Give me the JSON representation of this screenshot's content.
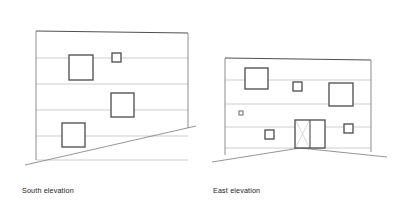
{
  "page": {
    "background_color": "#ffffff",
    "width": 393,
    "height": 216
  },
  "style": {
    "outline_color": "#3a3a3a",
    "floor_line_color": "#b9b9b9",
    "ground_line_color": "#7a7a7a",
    "opening_color": "#4a4a4a",
    "glazing_color": "#c9c9c9",
    "outline_width": 0.9,
    "floor_line_width": 0.7,
    "ground_line_width": 0.8,
    "opening_width": 1.3
  },
  "drawings": [
    {
      "id": "south-elevation",
      "caption": "South elevation",
      "caption_pos": {
        "x": 22,
        "y": 186
      },
      "outline": [
        {
          "x": 36,
          "y": 31
        },
        {
          "x": 188,
          "y": 33
        },
        {
          "x": 188,
          "y": 128
        },
        {
          "x": 36,
          "y": 160
        }
      ],
      "wall_left": {
        "x1": 36,
        "y1": 31,
        "x2": 36,
        "y2": 160
      },
      "wall_right": {
        "x1": 188,
        "y1": 33,
        "x2": 188,
        "y2": 128
      },
      "wall_top": {
        "x1": 36,
        "y1": 31,
        "x2": 188,
        "y2": 33
      },
      "floor_lines": [
        {
          "x1": 36,
          "y1": 58,
          "x2": 188,
          "y2": 58
        },
        {
          "x1": 36,
          "y1": 84,
          "x2": 188,
          "y2": 84
        },
        {
          "x1": 36,
          "y1": 110,
          "x2": 188,
          "y2": 110
        },
        {
          "x1": 36,
          "y1": 136,
          "x2": 188,
          "y2": 136
        },
        {
          "x1": 36,
          "y1": 160,
          "x2": 188,
          "y2": 160
        }
      ],
      "ground_line": {
        "x1": 25,
        "y1": 165,
        "x2": 196,
        "y2": 126
      },
      "openings": [
        {
          "name": "window-upper-left",
          "x": 69,
          "y": 55,
          "w": 24,
          "h": 25,
          "type": "window"
        },
        {
          "name": "window-small-upper",
          "x": 112,
          "y": 53,
          "w": 9,
          "h": 9,
          "type": "window-small"
        },
        {
          "name": "window-middle",
          "x": 111,
          "y": 93,
          "w": 23,
          "h": 24,
          "type": "window"
        },
        {
          "name": "window-lower-left",
          "x": 62,
          "y": 123,
          "w": 23,
          "h": 24,
          "type": "window"
        }
      ]
    },
    {
      "id": "east-elevation",
      "caption": "East elevation",
      "caption_pos": {
        "x": 213,
        "y": 186
      },
      "outline": [
        {
          "x": 225,
          "y": 58
        },
        {
          "x": 371,
          "y": 60
        },
        {
          "x": 371,
          "y": 152
        },
        {
          "x": 225,
          "y": 155
        }
      ],
      "wall_left": {
        "x1": 225,
        "y1": 58,
        "x2": 225,
        "y2": 155
      },
      "wall_right": {
        "x1": 371,
        "y1": 60,
        "x2": 371,
        "y2": 152
      },
      "wall_top": {
        "x1": 225,
        "y1": 58,
        "x2": 371,
        "y2": 60
      },
      "floor_lines": [
        {
          "x1": 225,
          "y1": 80,
          "x2": 371,
          "y2": 80
        },
        {
          "x1": 225,
          "y1": 104,
          "x2": 371,
          "y2": 104
        },
        {
          "x1": 225,
          "y1": 127,
          "x2": 371,
          "y2": 127
        },
        {
          "x1": 225,
          "y1": 148,
          "x2": 371,
          "y2": 148
        }
      ],
      "ground_line_left": {
        "x1": 212,
        "y1": 162,
        "x2": 300,
        "y2": 148
      },
      "ground_line_right": {
        "x1": 300,
        "y1": 148,
        "x2": 387,
        "y2": 157
      },
      "openings": [
        {
          "name": "window-upper-left",
          "x": 245,
          "y": 68,
          "w": 23,
          "h": 21,
          "type": "window"
        },
        {
          "name": "window-small-top-mid",
          "x": 293,
          "y": 82,
          "w": 9,
          "h": 9,
          "type": "window-small"
        },
        {
          "name": "window-upper-right",
          "x": 329,
          "y": 83,
          "w": 24,
          "h": 23,
          "type": "window"
        },
        {
          "name": "window-tiny-left",
          "x": 239,
          "y": 111,
          "w": 4,
          "h": 4,
          "type": "window-tiny"
        },
        {
          "name": "window-small-left",
          "x": 265,
          "y": 130,
          "w": 9,
          "h": 9,
          "type": "window-small"
        },
        {
          "name": "window-small-right",
          "x": 344,
          "y": 124,
          "w": 9,
          "h": 9,
          "type": "window-small"
        }
      ],
      "door": {
        "name": "glazed-double-door",
        "x": 295,
        "y": 120,
        "w": 30,
        "h": 28,
        "mullion_x": 310,
        "glazing_diagonals": [
          {
            "x1": 296,
            "y1": 121,
            "x2": 309,
            "y2": 147
          },
          {
            "x1": 309,
            "y1": 121,
            "x2": 296,
            "y2": 147
          }
        ]
      }
    }
  ]
}
